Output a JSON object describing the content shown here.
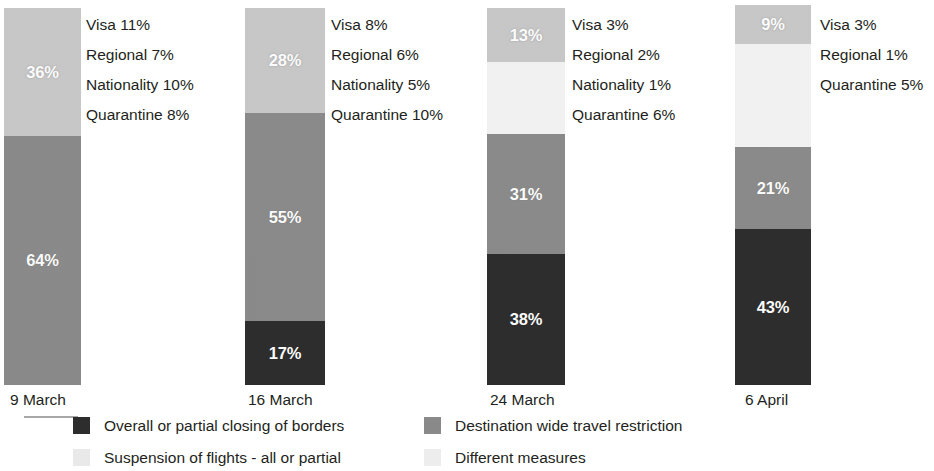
{
  "chart_data": {
    "type": "bar",
    "subtype": "stacked-column-100",
    "title": "",
    "subtitle": "",
    "xlabel": "",
    "ylabel": "",
    "ylim": [
      0,
      100
    ],
    "grid": false,
    "legend_position": "bottom",
    "categories": [
      "9 March",
      "16 March",
      "24 March",
      "6 April"
    ],
    "series": [
      {
        "name": "Overall or partial closing of borders",
        "color": "#2b2b2b",
        "values": [
          0,
          17,
          38,
          43
        ]
      },
      {
        "name": "Destination wide travel restriction",
        "color": "#8a8a8a",
        "values": [
          64,
          55,
          31,
          21
        ]
      },
      {
        "name": "Different measures",
        "color": "#f4f4f4",
        "values": [
          0,
          0,
          18,
          27
        ]
      },
      {
        "name": "Suspension of flights - all or partial",
        "color": "#c9c9c9",
        "values": [
          36,
          28,
          13,
          9
        ]
      }
    ],
    "annotations": [
      {
        "category": "9 March",
        "breakdown": [
          "Visa 11%",
          "Regional 7%",
          "Nationality 10%",
          "Quarantine 8%"
        ]
      },
      {
        "category": "16 March",
        "breakdown": [
          "Visa 8%",
          "Regional 6%",
          "Nationality 5%",
          "Quarantine 10%"
        ]
      },
      {
        "category": "24 March",
        "breakdown": [
          "Visa 3%",
          "Regional 2%",
          "Nationality 1%",
          "Quarantine 6%"
        ]
      },
      {
        "category": "6 April",
        "breakdown": [
          "Visa 3%",
          "Regional 1%",
          "Quarantine 5%"
        ]
      }
    ]
  },
  "bars": [
    {
      "axis_label": "9 March",
      "axis_label_x": 10,
      "x": 4,
      "y": 8,
      "width": 77,
      "height": 377,
      "labels_x": 86,
      "labels_y": 10,
      "segments": [
        {
          "label": "36%",
          "color": "#c9c9c9",
          "height": 128,
          "series": "Suspension of flights - all or partial"
        },
        {
          "label": "64%",
          "color": "#8a8a8a",
          "height": 249,
          "series": "Destination wide travel restriction"
        }
      ],
      "breakdown": [
        "Visa 11%",
        "Regional 7%",
        "Nationality 10%",
        "Quarantine 8%"
      ]
    },
    {
      "axis_label": "16 March",
      "axis_label_x": 248,
      "x": 245,
      "y": 8,
      "width": 80,
      "height": 377,
      "labels_x": 331,
      "labels_y": 10,
      "segments": [
        {
          "label": "28%",
          "color": "#c9c9c9",
          "height": 105,
          "series": "Suspension of flights - all or partial"
        },
        {
          "label": "55%",
          "color": "#8a8a8a",
          "height": 208,
          "series": "Destination wide travel restriction"
        },
        {
          "label": "17%",
          "color": "#2b2b2b",
          "height": 64,
          "series": "Overall or partial closing of borders"
        }
      ],
      "breakdown": [
        "Visa 8%",
        "Regional 6%",
        "Nationality 5%",
        "Quarantine 10%"
      ]
    },
    {
      "axis_label": "24 March",
      "axis_label_x": 490,
      "x": 487,
      "y": 8,
      "width": 78,
      "height": 377,
      "labels_x": 572,
      "labels_y": 10,
      "segments": [
        {
          "label": "13%",
          "color": "#c9c9c9",
          "height": 54,
          "series": "Suspension of flights - all or partial"
        },
        {
          "label": "",
          "color": "#f4f4f4",
          "height": 72,
          "series": "Different measures"
        },
        {
          "label": "31%",
          "color": "#8a8a8a",
          "height": 120,
          "series": "Destination wide travel restriction"
        },
        {
          "label": "38%",
          "color": "#2b2b2b",
          "height": 131,
          "series": "Overall or partial closing of borders"
        }
      ],
      "breakdown": [
        "Visa 3%",
        "Regional 2%",
        "Nationality 1%",
        "Quarantine 6%"
      ]
    },
    {
      "axis_label": "6 April",
      "axis_label_x": 745,
      "x": 735,
      "y": 5,
      "width": 76,
      "height": 380,
      "labels_x": 820,
      "labels_y": 10,
      "segments": [
        {
          "label": "9%",
          "color": "#c9c9c9",
          "height": 39,
          "series": "Suspension of flights - all or partial"
        },
        {
          "label": "",
          "color": "#f4f4f4",
          "height": 103,
          "series": "Different measures"
        },
        {
          "label": "21%",
          "color": "#8a8a8a",
          "height": 82,
          "series": "Destination wide travel restriction"
        },
        {
          "label": "43%",
          "color": "#2b2b2b",
          "height": 156,
          "series": "Overall or partial closing of borders"
        }
      ],
      "breakdown": [
        "Visa 3%",
        "Regional 1%",
        "Quarantine 5%"
      ]
    }
  ],
  "axis_labels_y": 392,
  "legend": {
    "items": [
      {
        "label": "Overall or partial closing of borders",
        "color": "#2b2b2b",
        "x": 73,
        "y": 2
      },
      {
        "label": "Destination wide travel restriction",
        "color": "#8a8a8a",
        "x": 424,
        "y": 2
      },
      {
        "label": "Suspension of flights - all or partial",
        "color": "#ececec",
        "x": 73,
        "y": 34
      },
      {
        "label": "Different measures",
        "color": "#f0f0f0",
        "x": 424,
        "y": 34
      }
    ]
  }
}
